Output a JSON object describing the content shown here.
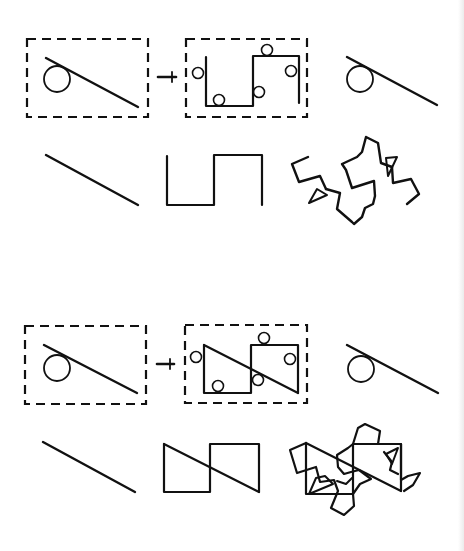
{
  "figure": {
    "panels": [
      {
        "id": "top",
        "row1": {
          "source_box": "dashed-box-circle-and-line",
          "arrow": "transform-arrow",
          "result_box": "dashed-box-square-wave-with-circles",
          "output": "circle-tangent-to-line"
        },
        "row2": {
          "items": [
            "straight-line",
            "square-wave",
            "rotated-square-wave-pattern"
          ]
        }
      },
      {
        "id": "bottom",
        "row1": {
          "source_box": "dashed-box-circle-and-line",
          "arrow": "transform-arrow",
          "result_box": "dashed-box-squares-with-diagonal-and-circles",
          "output": "circle-tangent-to-line"
        },
        "row2": {
          "items": [
            "straight-line",
            "two-squares-with-diagonal",
            "rotated-squares-pattern"
          ]
        }
      }
    ],
    "colors": {
      "ink": "#111111",
      "background": "#ffffff"
    }
  }
}
